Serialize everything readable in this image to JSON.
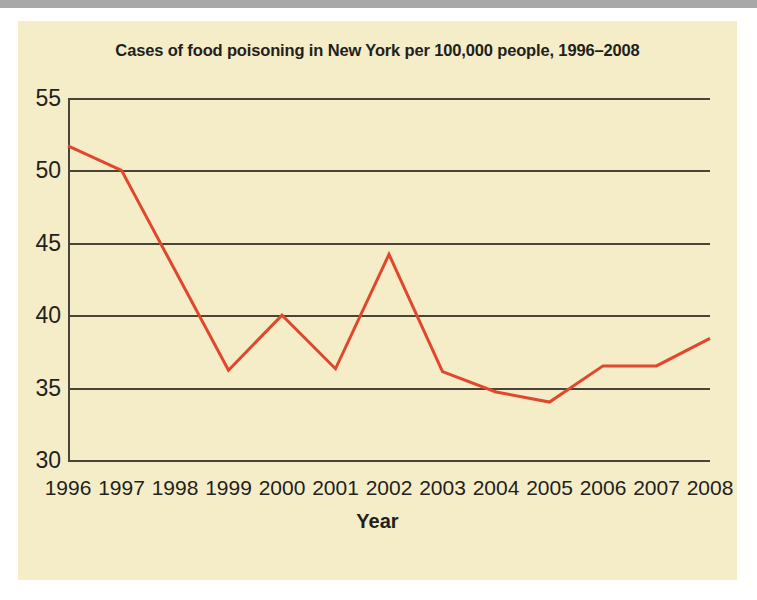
{
  "figure": {
    "title": "Cases of food poisoning in New York per 100,000 people, 1996–2008",
    "background_color": "#f5edc8",
    "page_background_color": "#ffffff",
    "top_bar_color": "#a8a8a8"
  },
  "chart_data": {
    "type": "line",
    "title": "Cases of food poisoning in New York per 100,000 people, 1996–2008",
    "xlabel": "Year",
    "ylabel": "",
    "categories": [
      "1996",
      "1997",
      "1998",
      "1999",
      "2000",
      "2001",
      "2002",
      "2003",
      "2004",
      "2005",
      "2006",
      "2007",
      "2008"
    ],
    "x": [
      1996,
      1997,
      1998,
      1999,
      2000,
      2001,
      2002,
      2003,
      2004,
      2005,
      2006,
      2007,
      2008
    ],
    "values": [
      51.7,
      50.0,
      43.1,
      36.2,
      40.0,
      36.3,
      44.2,
      36.1,
      34.7,
      34.0,
      36.5,
      36.5,
      38.4
    ],
    "series": [
      {
        "name": "Cases per 100,000 people",
        "color": "#e0472c",
        "values": [
          51.7,
          50.0,
          43.1,
          36.2,
          40.0,
          36.3,
          44.2,
          36.1,
          34.7,
          34.0,
          36.5,
          36.5,
          38.4
        ]
      }
    ],
    "ylim": [
      30,
      55
    ],
    "yticks": [
      30,
      35,
      40,
      45,
      50,
      55
    ],
    "ytick_labels": [
      "30",
      "35",
      "40",
      "45",
      "50",
      "55"
    ],
    "xlim": [
      1996,
      2008
    ],
    "grid": true,
    "grid_axis": "y",
    "grid_color": "#4a4438",
    "legend": false,
    "legend_position": "none",
    "markers": false,
    "line_width": 3
  }
}
